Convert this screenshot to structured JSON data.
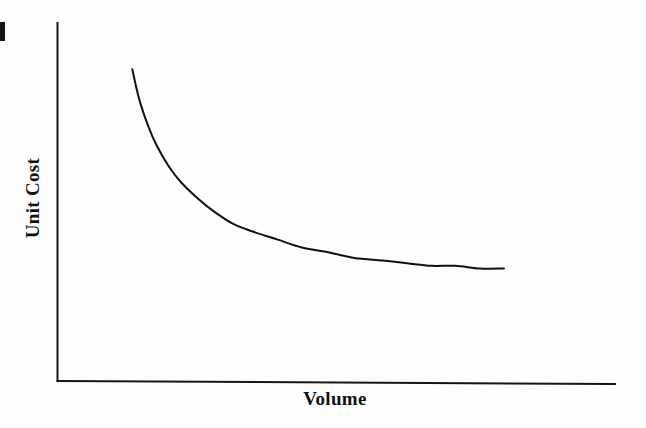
{
  "figure": {
    "background_color": "#fefefe",
    "ink_color": "#111111",
    "artifact": {
      "name": "page-edge-mark",
      "description": "black scan artifact at left edge"
    }
  },
  "chart_data": {
    "type": "line",
    "title": "",
    "subtitle": "",
    "xlabel": "Volume",
    "ylabel": "Unit Cost",
    "legend": [],
    "legend_position": "none",
    "grid": false,
    "axis_ticks": [],
    "xlim": [
      0,
      100
    ],
    "ylim": [
      0,
      100
    ],
    "x_tick_labels": [],
    "y_tick_labels": [],
    "annotations": [],
    "series": [
      {
        "name": "Unit Cost vs Volume",
        "color": "#111111",
        "line_width": 2,
        "x": [
          8,
          9,
          10,
          12,
          14,
          17,
          20,
          24,
          28,
          33,
          38,
          44,
          50,
          57,
          63,
          70,
          76,
          82,
          88,
          94,
          100
        ],
        "y": [
          93,
          86,
          80,
          71,
          64,
          56,
          50,
          44,
          39,
          34,
          31,
          28,
          25,
          23,
          21,
          20,
          19,
          18,
          18,
          17,
          17
        ]
      }
    ]
  },
  "axes": {
    "y_axis_label": "Unit Cost",
    "x_axis_label": "Volume"
  }
}
